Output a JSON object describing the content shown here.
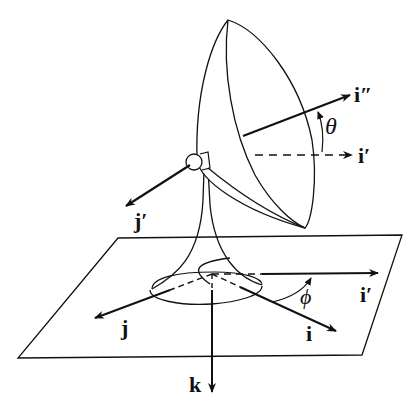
{
  "diagram": {
    "labels": {
      "i_double_prime": "i″",
      "i_prime_upper": "i′",
      "theta": "θ",
      "j_prime": "j′",
      "i_prime_lower": "i′",
      "phi": "ϕ",
      "j": "j",
      "i": "i",
      "k": "k"
    },
    "colors": {
      "ink": "#111111",
      "background": "#ffffff"
    }
  }
}
